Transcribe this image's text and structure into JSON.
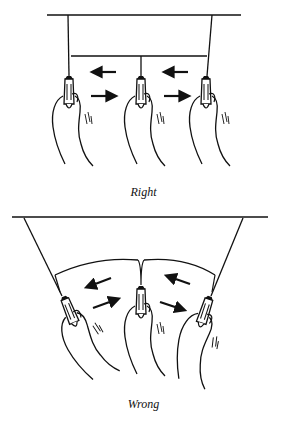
{
  "figure": {
    "panels": [
      {
        "id": "right",
        "caption": "Right",
        "description": "Three clips held level, frame lines straight, arrows horizontal"
      },
      {
        "id": "wrong",
        "caption": "Wrong",
        "description": "Three clips pulled unevenly, frame bowed into arc, arrows angled"
      }
    ],
    "colors": {
      "ink": "#111111",
      "background": "#ffffff"
    }
  }
}
